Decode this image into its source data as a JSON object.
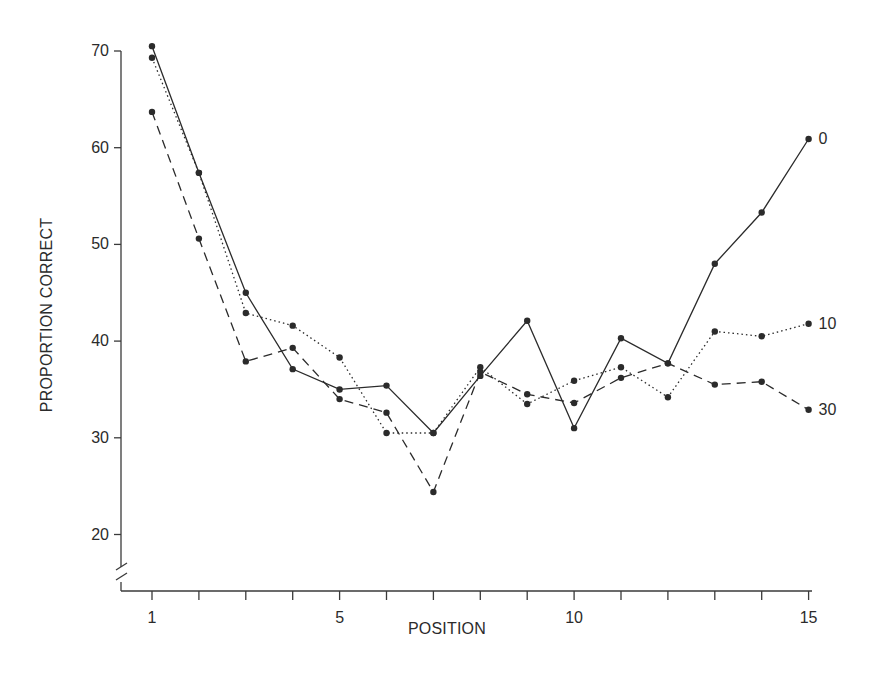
{
  "chart_data": {
    "type": "line",
    "title": "",
    "xlabel": "POSITION",
    "ylabel": "PROPORTION CORRECT",
    "x": [
      1,
      2,
      3,
      4,
      5,
      6,
      7,
      8,
      9,
      10,
      11,
      12,
      13,
      14,
      15
    ],
    "xticks": [
      1,
      2,
      3,
      4,
      5,
      6,
      7,
      8,
      9,
      10,
      11,
      12,
      13,
      14,
      15
    ],
    "xtick_labels": [
      "1",
      "",
      "",
      "",
      "5",
      "",
      "",
      "",
      "",
      "10",
      "",
      "",
      "",
      "",
      "15"
    ],
    "yticks": [
      20,
      30,
      40,
      50,
      60,
      70
    ],
    "ytick_labels": [
      "20",
      "30",
      "40",
      "50",
      "60",
      "70"
    ],
    "ylim": [
      15,
      71
    ],
    "xlim": [
      0.4,
      15
    ],
    "y_axis_break": true,
    "grid": false,
    "legend": "inline labels at line ends",
    "series": [
      {
        "name": "0",
        "style": "solid",
        "values": [
          70.5,
          57.4,
          45.0,
          37.1,
          35.0,
          35.4,
          30.5,
          36.4,
          42.1,
          31.0,
          40.3,
          37.7,
          48.0,
          53.3,
          60.9
        ]
      },
      {
        "name": "10",
        "style": "dotted",
        "values": [
          69.3,
          57.4,
          42.9,
          41.6,
          38.3,
          30.5,
          30.5,
          37.3,
          33.5,
          35.9,
          37.3,
          34.2,
          41.0,
          40.5,
          41.8
        ]
      },
      {
        "name": "30",
        "style": "dashed",
        "values": [
          63.7,
          50.6,
          37.9,
          39.3,
          34.0,
          32.6,
          24.4,
          36.8,
          34.5,
          33.6,
          36.2,
          37.7,
          35.5,
          35.8,
          32.9
        ]
      }
    ]
  },
  "colors": {
    "line": "#2b2b2b",
    "axis": "#3a3a3a",
    "background": "#ffffff"
  }
}
